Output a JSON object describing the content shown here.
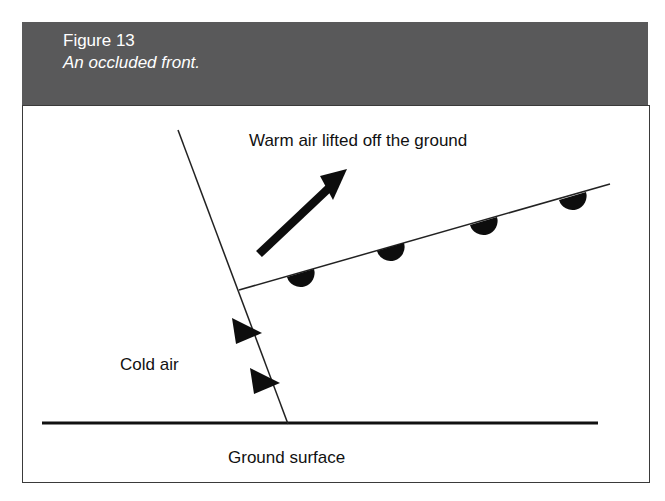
{
  "caption": {
    "figure_number": "Figure 13",
    "title": "An occluded front.",
    "band_color": "#59595a",
    "text_color": "#ffffff"
  },
  "diagram": {
    "type": "meteorological-cross-section",
    "subject": "occluded front",
    "background": "#ffffff",
    "border_color": "#3a3a3a",
    "line_color": "#1a1a1a",
    "labels": {
      "warm_air": "Warm air lifted off the ground",
      "cold_air": "Cold air",
      "ground_surface": "Ground surface"
    },
    "ground_line": {
      "name": "ground-surface-line",
      "x1": 42,
      "y1": 423,
      "x2": 598,
      "y2": 423,
      "thickness": 3
    },
    "cold_front": {
      "name": "cold-front-line",
      "x1": 178,
      "y1": 130,
      "x2": 288,
      "y2": 424,
      "thickness": 1.4,
      "symbol": "triangle",
      "symbol_count": 2,
      "symbols": [
        {
          "x": 237,
          "y": 330
        },
        {
          "x": 255,
          "y": 380
        }
      ]
    },
    "warm_front": {
      "name": "warm-front-line",
      "x1": 239,
      "y1": 290,
      "x2": 610,
      "y2": 184,
      "thickness": 1.4,
      "symbol": "semicircle",
      "symbol_direction": "below-line",
      "symbol_count": 4,
      "symbols": [
        {
          "x": 300,
          "y": 273
        },
        {
          "x": 390,
          "y": 247
        },
        {
          "x": 483,
          "y": 221
        },
        {
          "x": 572,
          "y": 196
        }
      ]
    },
    "lift_arrow": {
      "name": "warm-air-lift-arrow",
      "x1": 258,
      "y1": 253,
      "x2": 347,
      "y2": 169,
      "thickness": 8,
      "head_length": 27,
      "head_width": 22
    },
    "triple_point": {
      "x": 239,
      "y": 290
    }
  }
}
